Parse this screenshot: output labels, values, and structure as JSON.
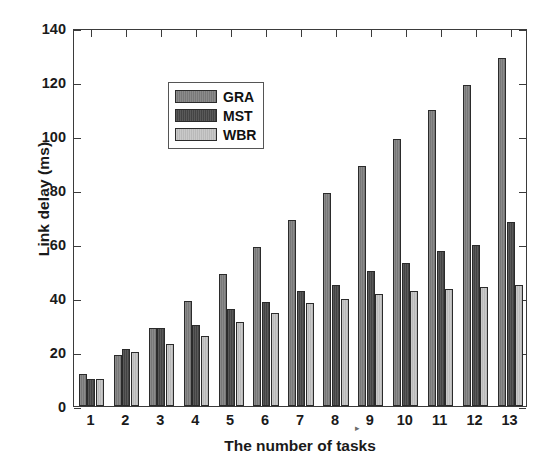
{
  "chart_data": {
    "type": "bar",
    "title": "",
    "xlabel": "The number of tasks",
    "ylabel": "Link delay (ms)",
    "categories": [
      "1",
      "2",
      "3",
      "4",
      "5",
      "6",
      "7",
      "8",
      "9",
      "10",
      "11",
      "12",
      "13"
    ],
    "ylim": [
      0,
      140
    ],
    "yticks": [
      0,
      20,
      40,
      60,
      80,
      100,
      120,
      140
    ],
    "grid": false,
    "legend_position": "upper left",
    "series": [
      {
        "name": "GRA",
        "color": "#7e7e7e",
        "values": [
          12,
          19,
          29,
          39,
          49,
          59,
          69,
          79,
          89,
          99,
          109.5,
          119,
          129
        ]
      },
      {
        "name": "MST",
        "color": "#474747",
        "values": [
          10,
          21,
          29,
          30,
          36,
          38.5,
          42.5,
          45,
          50,
          53,
          57.5,
          59.5,
          68
        ]
      },
      {
        "name": "WBR",
        "color": "#c3c3c3",
        "values": [
          10,
          20,
          23,
          26,
          31,
          34.5,
          38,
          39.5,
          41.5,
          42.5,
          43.5,
          44,
          45
        ]
      }
    ]
  },
  "legend": {
    "entries": [
      {
        "label": "GRA"
      },
      {
        "label": "MST"
      },
      {
        "label": "WBR"
      }
    ]
  },
  "artifact": {
    "mark": "▸"
  }
}
